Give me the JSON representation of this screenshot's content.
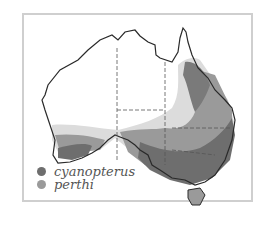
{
  "figure": {
    "type": "species distribution map",
    "region": "Australia",
    "legend": [
      {
        "label": "cyanopterus",
        "color": "#6e6e6e"
      },
      {
        "label": "perthi",
        "color": "#9a9a9a"
      }
    ],
    "colors": {
      "frame": "#cfcfcf",
      "outline": "#2a2a2a",
      "cyanopterus_range": "#6e6e6e",
      "perthi_range": "#9a9a9a",
      "light_range": "#dcdcdc",
      "land": "#ffffff"
    }
  }
}
